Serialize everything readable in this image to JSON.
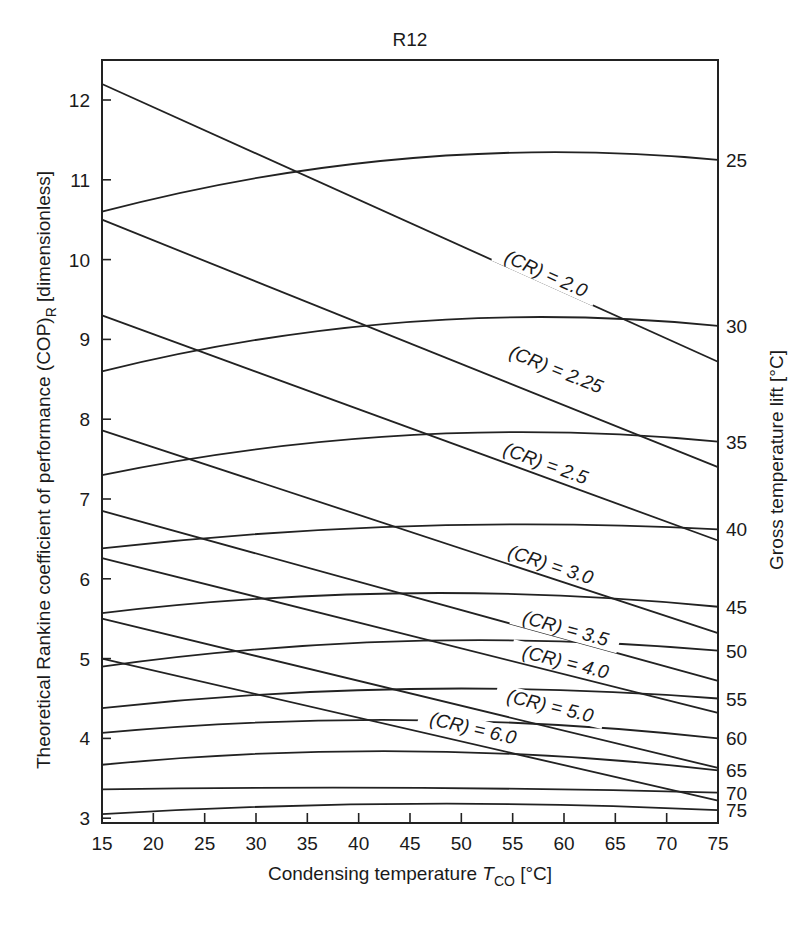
{
  "chart_data": {
    "type": "line",
    "title": "R12",
    "xlabel": "Condensing temperature T_CO [°C]",
    "xlabel_main": "Condensing temperature ",
    "xlabel_italic": "T",
    "xlabel_sub": "CO",
    "xlabel_unit": " [°C]",
    "ylabel": "Theoretical Rankine coefficient of performance (COP)_R [dimensionless]",
    "ylabel_main": "Theoretical Rankine coefficient of performance (COP)",
    "ylabel_sub": "R",
    "ylabel_unit": " [dimensionless]",
    "y2label": "Gross temperature lift [°C]",
    "xlim": [
      15,
      75
    ],
    "ylim": [
      2.95,
      12.5
    ],
    "grid": false,
    "x_ticks": [
      15,
      20,
      25,
      30,
      35,
      40,
      45,
      50,
      55,
      60,
      65,
      70,
      75
    ],
    "y_ticks": [
      3,
      4,
      5,
      6,
      7,
      8,
      9,
      10,
      11,
      12
    ],
    "x": [
      15,
      45,
      75
    ],
    "lift_series": [
      {
        "name": "25",
        "values": [
          10.6,
          11.27,
          11.25
        ]
      },
      {
        "name": "30",
        "values": [
          8.6,
          9.22,
          9.17
        ]
      },
      {
        "name": "35",
        "values": [
          7.3,
          7.8,
          7.72
        ]
      },
      {
        "name": "40",
        "values": [
          6.38,
          6.66,
          6.62
        ]
      },
      {
        "name": "45",
        "values": [
          5.57,
          5.82,
          5.65
        ]
      },
      {
        "name": "50",
        "values": [
          4.9,
          5.22,
          5.1
        ]
      },
      {
        "name": "55",
        "values": [
          4.38,
          4.62,
          4.5
        ]
      },
      {
        "name": "60",
        "values": [
          4.07,
          4.23,
          4.0
        ]
      },
      {
        "name": "65",
        "values": [
          3.67,
          3.84,
          3.6
        ]
      },
      {
        "name": "70",
        "values": [
          3.36,
          3.38,
          3.32
        ]
      },
      {
        "name": "75",
        "values": [
          3.05,
          3.18,
          3.1
        ]
      }
    ],
    "cr_series": [
      {
        "name": "(CR) = 2.0",
        "x": [
          15,
          75
        ],
        "values": [
          12.2,
          8.72
        ]
      },
      {
        "name": "(CR) = 2.25",
        "x": [
          15,
          75
        ],
        "values": [
          10.5,
          7.4
        ]
      },
      {
        "name": "(CR) = 2.5",
        "x": [
          15,
          75
        ],
        "values": [
          9.3,
          6.48
        ]
      },
      {
        "name": "(CR) = 3.0",
        "x": [
          15,
          75
        ],
        "values": [
          7.86,
          5.32
        ]
      },
      {
        "name": "(CR) = 3.5",
        "x": [
          15,
          75
        ],
        "values": [
          6.85,
          4.72
        ]
      },
      {
        "name": "(CR) = 4.0",
        "x": [
          15,
          75
        ],
        "values": [
          6.26,
          4.32
        ]
      },
      {
        "name": "(CR) = 5.0",
        "x": [
          15,
          75
        ],
        "values": [
          5.5,
          3.63
        ]
      },
      {
        "name": "(CR) = 6.0",
        "x": [
          15,
          75
        ],
        "values": [
          5.0,
          3.22
        ]
      }
    ],
    "cr_label_positions": [
      {
        "T": 58,
        "v": 9.75
      },
      {
        "T": 59,
        "v": 8.55
      },
      {
        "T": 58,
        "v": 7.37
      },
      {
        "T": 58.5,
        "v": 6.1
      },
      {
        "T": 60,
        "v": 5.3
      },
      {
        "T": 60,
        "v": 4.88
      },
      {
        "T": 58.5,
        "v": 4.33
      },
      {
        "T": 51,
        "v": 4.05
      }
    ]
  },
  "axes": {
    "x_tick_labels": [
      "15",
      "20",
      "25",
      "30",
      "35",
      "40",
      "45",
      "50",
      "55",
      "60",
      "65",
      "70",
      "75"
    ],
    "y_tick_labels": [
      "3",
      "4",
      "5",
      "6",
      "7",
      "8",
      "9",
      "10",
      "11",
      "12"
    ],
    "right_labels": [
      "25",
      "30",
      "35",
      "40",
      "45",
      "50",
      "55",
      "60",
      "65",
      "70",
      "75"
    ]
  }
}
